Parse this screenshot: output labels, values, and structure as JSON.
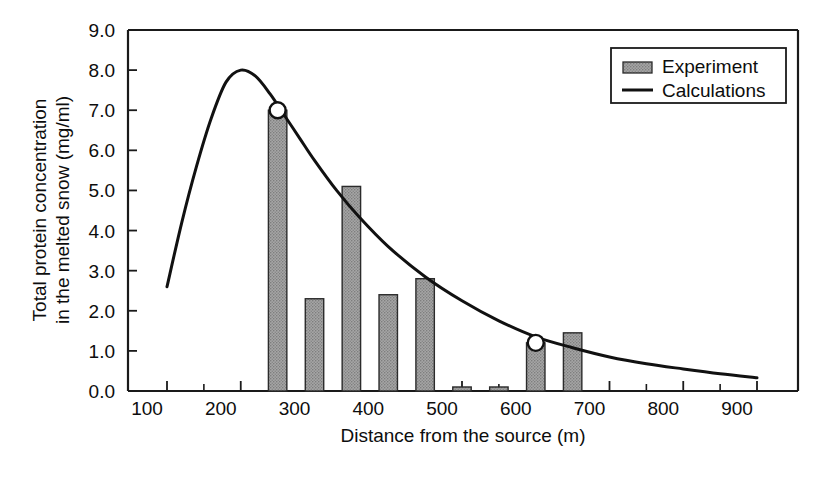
{
  "chart_data": {
    "type": "bar",
    "title": "",
    "xlabel": "Distance from the source (m)",
    "ylabel": "Total protein concentration in the melted snow (mg/ml)",
    "xlim": [
      100,
      900
    ],
    "ylim": [
      0.0,
      9.0
    ],
    "grid": false,
    "legend_position": "top-right",
    "x_ticklabels": [
      "100",
      "200",
      "300",
      "400",
      "500",
      "600",
      "700",
      "800",
      "900"
    ],
    "x_tickvalues": [
      100,
      200,
      300,
      400,
      500,
      600,
      700,
      800,
      900
    ],
    "x_minor_tick_interval": 50,
    "y_ticklabels": [
      "0.0",
      "1.0",
      "2.0",
      "3.0",
      "4.0",
      "5.0",
      "6.0",
      "7.0",
      "8.0",
      "9.0"
    ],
    "y_tickvalues": [
      0.0,
      1.0,
      2.0,
      3.0,
      4.0,
      5.0,
      6.0,
      7.0,
      8.0,
      9.0
    ],
    "series": [
      {
        "name": "Experiment",
        "type": "bar",
        "bar_width": 25,
        "categories": [
          250,
          300,
          350,
          400,
          450,
          500,
          550,
          600,
          650
        ],
        "values": [
          7.0,
          2.3,
          5.1,
          2.4,
          2.8,
          0.1,
          0.1,
          1.2,
          1.45
        ]
      },
      {
        "name": "Calculations",
        "type": "line",
        "x": [
          100,
          120,
          140,
          160,
          180,
          200,
          220,
          240,
          260,
          280,
          300,
          330,
          360,
          400,
          450,
          500,
          550,
          600,
          650,
          700,
          750,
          800,
          850,
          900
        ],
        "y": [
          2.6,
          4.2,
          5.6,
          6.8,
          7.7,
          8.0,
          7.85,
          7.4,
          6.85,
          6.3,
          5.75,
          5.0,
          4.35,
          3.6,
          2.85,
          2.25,
          1.75,
          1.35,
          1.08,
          0.85,
          0.68,
          0.55,
          0.43,
          0.33
        ]
      }
    ],
    "markers": [
      {
        "x": 250,
        "y": 7.0,
        "shape": "open-circle"
      },
      {
        "x": 600,
        "y": 1.2,
        "shape": "open-circle"
      }
    ],
    "legend": [
      {
        "label": "Experiment",
        "kind": "swatch"
      },
      {
        "label": "Calculations",
        "kind": "line"
      }
    ]
  },
  "colors": {
    "bar_fill": "#9d9d9d",
    "bar_edge": "#2b2b2b",
    "curve": "#111111",
    "axis": "#1a1a1a",
    "text": "#0d0d0d",
    "background": "#ffffff"
  }
}
